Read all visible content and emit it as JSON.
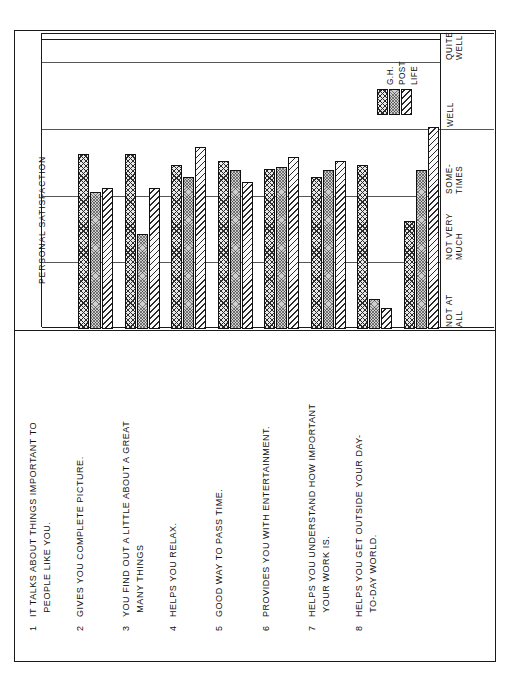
{
  "axis_title": "PERSONAL SATISFACTION",
  "scale_labels": [
    "NOT AT\nALL",
    "NOT VERY\nMUCH",
    "SOME-\nTIMES",
    "WELL",
    "QUITE\nWELL"
  ],
  "legend": [
    {
      "key": "gh",
      "label": "G.H."
    },
    {
      "key": "post",
      "label": "POST"
    },
    {
      "key": "life",
      "label": "LIFE"
    }
  ],
  "items": [
    {
      "num": "1",
      "line1": "IT TALKS ABOUT THINGS IMPORTANT TO",
      "line2": "PEOPLE LIKE YOU."
    },
    {
      "num": "2",
      "line1": "GIVES YOU COMPLETE PICTURE.",
      "line2": ""
    },
    {
      "num": "3",
      "line1": "YOU FIND OUT A LITTLE ABOUT A GREAT",
      "line2": "MANY THINGS"
    },
    {
      "num": "4",
      "line1": "HELPS YOU RELAX.",
      "line2": ""
    },
    {
      "num": "5",
      "line1": "GOOD WAY TO PASS TIME.",
      "line2": ""
    },
    {
      "num": "6",
      "line1": "PROVIDES YOU WITH ENTERTAINMENT.",
      "line2": ""
    },
    {
      "num": "7",
      "line1": "HELPS YOU UNDERSTAND HOW IMPORTANT",
      "line2": "YOUR WORK IS."
    },
    {
      "num": "8",
      "line1": "HELPS YOU GET OUTSIDE YOUR DAY-",
      "line2": "TO-DAY WORLD."
    }
  ],
  "chart_data": {
    "type": "bar",
    "title": "PERSONAL SATISFACTION",
    "xlabel": "",
    "ylabel": "PERSONAL SATISFACTION",
    "orientation": "vertical-grouped",
    "grid": true,
    "legend_position": "top-right",
    "scale_ticks": [
      "NOT AT ALL",
      "NOT VERY MUCH",
      "SOME-TIMES",
      "WELL",
      "QUITE WELL"
    ],
    "ylim": [
      1,
      5
    ],
    "categories": [
      "1 IT TALKS ABOUT THINGS IMPORTANT TO PEOPLE LIKE YOU.",
      "2 GIVES YOU COMPLETE PICTURE.",
      "3 YOU FIND OUT A LITTLE ABOUT A GREAT MANY THINGS",
      "4 HELPS YOU RELAX.",
      "5 GOOD WAY TO PASS TIME.",
      "6 PROVIDES YOU WITH ENTERTAINMENT.",
      "7 HELPS YOU UNDERSTAND HOW IMPORTANT YOUR WORK IS.",
      "8 HELPS YOU GET OUTSIDE YOUR DAY-TO-DAY WORLD."
    ],
    "series": [
      {
        "name": "G.H.",
        "fill": "cross-hatch",
        "values": [
          3.62,
          3.62,
          3.45,
          3.52,
          3.4,
          3.28,
          3.45,
          2.62
        ]
      },
      {
        "name": "POST",
        "fill": "dotted-gray",
        "values": [
          3.05,
          2.42,
          3.28,
          3.38,
          3.42,
          3.38,
          1.45,
          3.38
        ]
      },
      {
        "name": "LIFE",
        "fill": "diagonal-hatch",
        "values": [
          3.12,
          3.12,
          3.72,
          3.2,
          3.58,
          3.52,
          1.32,
          4.02
        ]
      }
    ]
  }
}
